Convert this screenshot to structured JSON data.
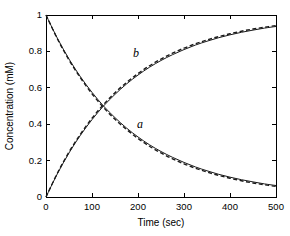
{
  "chart_data": {
    "type": "line",
    "title": "",
    "xlabel": "Time (sec)",
    "ylabel": "Concentration (mM)",
    "xlim": [
      0,
      500
    ],
    "ylim": [
      0,
      1
    ],
    "xticks": [
      0,
      100,
      200,
      300,
      400,
      500
    ],
    "yticks": [
      0,
      0.2,
      0.4,
      0.6,
      0.8,
      1
    ],
    "xticklabels": [
      "0",
      "100",
      "200",
      "300",
      "400",
      "500"
    ],
    "yticklabels": [
      "0",
      "0.2",
      "0.4",
      "0.6",
      "0.8",
      "1"
    ],
    "grid": false,
    "legend": "none",
    "annotations": [
      {
        "text": "a",
        "x": 205,
        "y": 0.39,
        "style": "italic"
      },
      {
        "text": "b",
        "x": 190,
        "y": 0.81,
        "style": "italic"
      }
    ],
    "x": [
      0,
      25,
      50,
      75,
      100,
      125,
      150,
      175,
      200,
      225,
      250,
      275,
      300,
      325,
      350,
      375,
      400,
      425,
      450,
      475,
      500
    ],
    "series": [
      {
        "name": "a",
        "linestyle": "solid",
        "color": "#1a1a1a",
        "values": [
          1.0,
          0.871,
          0.758,
          0.66,
          0.575,
          0.5,
          0.436,
          0.379,
          0.33,
          0.287,
          0.25,
          0.218,
          0.19,
          0.165,
          0.144,
          0.125,
          0.109,
          0.095,
          0.083,
          0.072,
          0.063
        ]
      },
      {
        "name": "a-dashed",
        "linestyle": "dashed",
        "color": "#1a1a1a",
        "values": [
          1.0,
          0.868,
          0.753,
          0.654,
          0.567,
          0.492,
          0.427,
          0.371,
          0.322,
          0.279,
          0.242,
          0.21,
          0.182,
          0.158,
          0.137,
          0.119,
          0.103,
          0.089,
          0.077,
          0.067,
          0.058
        ]
      },
      {
        "name": "b",
        "linestyle": "solid",
        "color": "#1a1a1a",
        "values": [
          0.0,
          0.129,
          0.242,
          0.34,
          0.425,
          0.5,
          0.564,
          0.621,
          0.67,
          0.713,
          0.75,
          0.782,
          0.81,
          0.835,
          0.856,
          0.875,
          0.891,
          0.905,
          0.917,
          0.928,
          0.937
        ]
      },
      {
        "name": "b-dashed",
        "linestyle": "dashed",
        "color": "#1a1a1a",
        "values": [
          0.0,
          0.132,
          0.247,
          0.346,
          0.433,
          0.508,
          0.573,
          0.629,
          0.678,
          0.721,
          0.758,
          0.79,
          0.818,
          0.842,
          0.863,
          0.881,
          0.897,
          0.911,
          0.923,
          0.933,
          0.942
        ]
      }
    ]
  },
  "axes": {
    "x_title": "Time (sec)",
    "y_title": "Concentration (mM)",
    "x_tick_labels": [
      "0",
      "100",
      "200",
      "300",
      "400",
      "500"
    ],
    "y_tick_labels": [
      "1",
      "0.8",
      "0.6",
      "0.4",
      "0.2",
      "0"
    ]
  },
  "labels": {
    "curve_a": "a",
    "curve_b": "b"
  },
  "colors": {
    "axis": "#000000",
    "curve": "#1a1a1a",
    "background": "#ffffff"
  }
}
